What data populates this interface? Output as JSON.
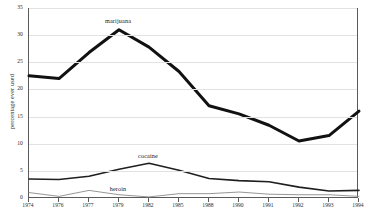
{
  "chart_data": {
    "type": "line",
    "title": "",
    "xlabel": "",
    "ylabel": "percentage ever used",
    "ylim": [
      0,
      35
    ],
    "yticks": [
      0,
      5,
      10,
      15,
      20,
      25,
      30,
      35
    ],
    "ytick_labels": [
      "0",
      "5",
      "10",
      "15",
      "20",
      "25",
      "30",
      "35"
    ],
    "grid": true,
    "legend_position": "inline-annotations",
    "categories": [
      "1974",
      "1976",
      "1977",
      "1979",
      "1982",
      "1985",
      "1988",
      "1990",
      "1991",
      "1992",
      "1993",
      "1994"
    ],
    "series": [
      {
        "name": "marijuana",
        "color": "#111111",
        "line_width": 3.0,
        "values": [
          22.5,
          22.0,
          26.8,
          31.0,
          27.8,
          23.3,
          17.0,
          15.5,
          13.4,
          10.5,
          11.5,
          16.0
        ]
      },
      {
        "name": "cocaine",
        "color": "#1f1f1f",
        "line_width": 1.6,
        "values": [
          3.5,
          3.4,
          4.0,
          5.3,
          6.4,
          5.1,
          3.6,
          3.2,
          3.0,
          2.0,
          1.3,
          1.4
        ]
      },
      {
        "name": "heroin",
        "color": "#8a8a8a",
        "line_width": 0.9,
        "values": [
          1.0,
          0.3,
          1.4,
          0.6,
          0.2,
          0.8,
          0.8,
          1.1,
          0.7,
          0.6,
          0.6,
          0.3
        ]
      }
    ],
    "annotations": [
      {
        "text": "marijuana",
        "series": "marijuana",
        "x_index": 3,
        "y_value": 31.0
      },
      {
        "text": "cocaine",
        "series": "cocaine",
        "x_index": 4,
        "y_value": 6.4
      },
      {
        "text": "heroin",
        "series": "heroin",
        "x_index": 3,
        "y_value": 0.6
      }
    ]
  },
  "axes": {
    "frame_color": "#5a5a5a",
    "grid_color": "#e2e2e2"
  }
}
